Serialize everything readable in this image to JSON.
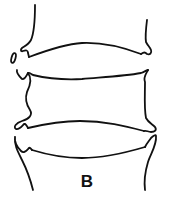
{
  "figure": {
    "panel_label": "B",
    "stroke_color": "#111111",
    "background_color": "#ffffff"
  }
}
